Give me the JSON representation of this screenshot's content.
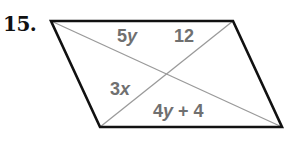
{
  "problem": {
    "number": "15."
  },
  "figure": {
    "type": "parallelogram-with-diagonals",
    "vertices": {
      "top_left": [
        51,
        21
      ],
      "top_right": [
        233,
        21
      ],
      "bottom_left": [
        100,
        127
      ],
      "bottom_right": [
        282,
        127
      ]
    },
    "labels": {
      "upper_left_segment": {
        "coef": "5",
        "var": "y"
      },
      "upper_right_segment": {
        "value": "12"
      },
      "lower_left_segment": {
        "coef": "3",
        "var": "x"
      },
      "lower_right_segment": {
        "coef": "4",
        "var": "y",
        "rest": " + 4"
      }
    },
    "colors": {
      "outline": "#111111",
      "diagonal": "#9a9a9a",
      "label": "#707070"
    }
  }
}
